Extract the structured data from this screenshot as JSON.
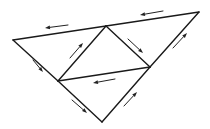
{
  "diagram": {
    "type": "triangulated-flow",
    "stroke_color": "#1a1a1a",
    "arrow_color": "#222222",
    "background": "#ffffff",
    "vertices": {
      "left": [
        13,
        40
      ],
      "top_mid": [
        106,
        26
      ],
      "top_right": [
        199,
        12
      ],
      "mid_left": [
        58,
        81
      ],
      "mid_right": [
        150,
        67
      ],
      "bottom": [
        102,
        122
      ]
    },
    "edges": [
      {
        "id": "top-left-edge",
        "from": "left",
        "to": "top_mid"
      },
      {
        "id": "top-right-edge",
        "from": "top_mid",
        "to": "top_right"
      },
      {
        "id": "left-upper-edge",
        "from": "left",
        "to": "mid_left"
      },
      {
        "id": "left-lower-edge",
        "from": "mid_left",
        "to": "bottom"
      },
      {
        "id": "right-upper-edge",
        "from": "top_right",
        "to": "mid_right"
      },
      {
        "id": "right-lower-edge",
        "from": "mid_right",
        "to": "bottom"
      },
      {
        "id": "inner-left-edge",
        "from": "mid_left",
        "to": "top_mid"
      },
      {
        "id": "inner-right-edge",
        "from": "top_mid",
        "to": "mid_right"
      },
      {
        "id": "inner-middle-edge",
        "from": "mid_left",
        "to": "mid_right"
      }
    ],
    "arrows": [
      {
        "id": "arrow-top-left",
        "tail": [
          68,
          25
        ],
        "head": [
          45,
          28
        ],
        "direction": "left"
      },
      {
        "id": "arrow-top-right",
        "tail": [
          163,
          11
        ],
        "head": [
          140,
          15
        ],
        "direction": "left"
      },
      {
        "id": "arrow-left-upper",
        "tail": [
          33,
          60
        ],
        "head": [
          43,
          72
        ],
        "direction": "down-right"
      },
      {
        "id": "arrow-inner-left",
        "tail": [
          70,
          58
        ],
        "head": [
          83,
          43
        ],
        "direction": "up-right"
      },
      {
        "id": "arrow-inner-right",
        "tail": [
          128,
          39
        ],
        "head": [
          143,
          53
        ],
        "direction": "down-right"
      },
      {
        "id": "arrow-right-upper",
        "tail": [
          173,
          48
        ],
        "head": [
          187,
          33
        ],
        "direction": "up-right"
      },
      {
        "id": "arrow-inner-middle",
        "tail": [
          115,
          79
        ],
        "head": [
          93,
          83
        ],
        "direction": "left"
      },
      {
        "id": "arrow-left-lower",
        "tail": [
          72,
          100
        ],
        "head": [
          87,
          113
        ],
        "direction": "down-right"
      },
      {
        "id": "arrow-right-lower",
        "tail": [
          124,
          106
        ],
        "head": [
          137,
          92
        ],
        "direction": "up-right"
      }
    ]
  }
}
